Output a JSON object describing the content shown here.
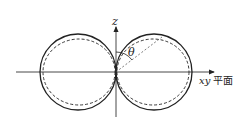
{
  "diagram": {
    "type": "radiation-pattern",
    "labels": {
      "z_axis": "z",
      "angle": "θ",
      "plane_var": "xy",
      "plane_text": "平面"
    },
    "curves": [
      {
        "name": "solid-pattern",
        "style": "solid"
      },
      {
        "name": "dashed-pattern",
        "style": "dashed"
      }
    ],
    "colors": {
      "stroke": "#222222",
      "background": "#ffffff"
    }
  }
}
